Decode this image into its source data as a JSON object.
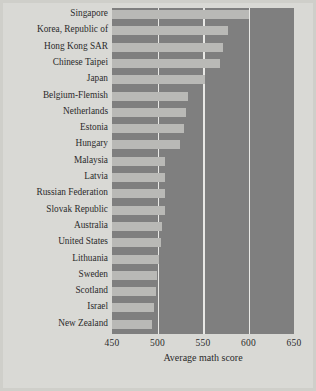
{
  "chart_data": {
    "type": "bar",
    "orientation": "horizontal",
    "title": "",
    "xlabel": "Average math score",
    "ylabel": "",
    "xlim": [
      450,
      650
    ],
    "xticks": [
      450,
      500,
      550,
      600,
      650
    ],
    "gridlines": [
      500,
      550,
      600
    ],
    "grid": true,
    "legend": null,
    "categories": [
      "Singapore",
      "Korea, Republic of",
      "Hong Kong SAR",
      "Chinese Taipei",
      "Japan",
      "Belgium-Flemish",
      "Netherlands",
      "Estonia",
      "Hungary",
      "Malaysia",
      "Latvia",
      "Russian Federation",
      "Slovak Republic",
      "Australia",
      "United States",
      "Lithuania",
      "Sweden",
      "Scotland",
      "Israel",
      "New Zealand"
    ],
    "values": [
      600,
      577,
      572,
      569,
      552,
      533,
      531,
      529,
      525,
      508,
      508,
      508,
      508,
      505,
      504,
      502,
      499,
      498,
      496,
      494
    ]
  },
  "colors": {
    "figure_background": "#d9d9d5",
    "plot_background": "#7f7f7f",
    "bar": "#b9b9b6",
    "gridline": "#e9e9e6",
    "text": "#2b2b2b",
    "border": "#cfcfca"
  }
}
